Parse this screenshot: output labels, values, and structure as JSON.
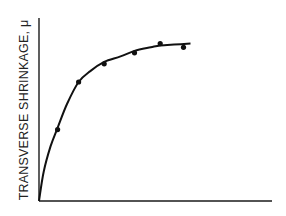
{
  "chart_data": {
    "type": "scatter",
    "title": "",
    "xlabel": "",
    "ylabel": "TRANSVERSE SHRINKAGE, μ",
    "xlim": [
      0,
      1
    ],
    "ylim": [
      0,
      1
    ],
    "grid": false,
    "legend": null,
    "x_ticks": [],
    "y_ticks": [],
    "series": [
      {
        "name": "measured",
        "kind": "points",
        "x": [
          0.08,
          0.17,
          0.28,
          0.41,
          0.52,
          0.62
        ],
        "y": [
          0.39,
          0.65,
          0.75,
          0.81,
          0.86,
          0.84
        ]
      },
      {
        "name": "fitted curve",
        "kind": "line",
        "x": [
          0.0,
          0.02,
          0.05,
          0.08,
          0.12,
          0.17,
          0.22,
          0.28,
          0.35,
          0.41,
          0.48,
          0.52,
          0.58,
          0.65
        ],
        "y": [
          0.0,
          0.16,
          0.3,
          0.4,
          0.53,
          0.65,
          0.71,
          0.76,
          0.79,
          0.82,
          0.84,
          0.85,
          0.855,
          0.86
        ]
      }
    ],
    "colors": {
      "axis": "#1a1a1a",
      "curve": "#111111",
      "points": "#111111"
    }
  },
  "plot": {
    "origin_px": [
      39,
      201
    ],
    "x_end_px": 272,
    "y_end_px": 18
  }
}
